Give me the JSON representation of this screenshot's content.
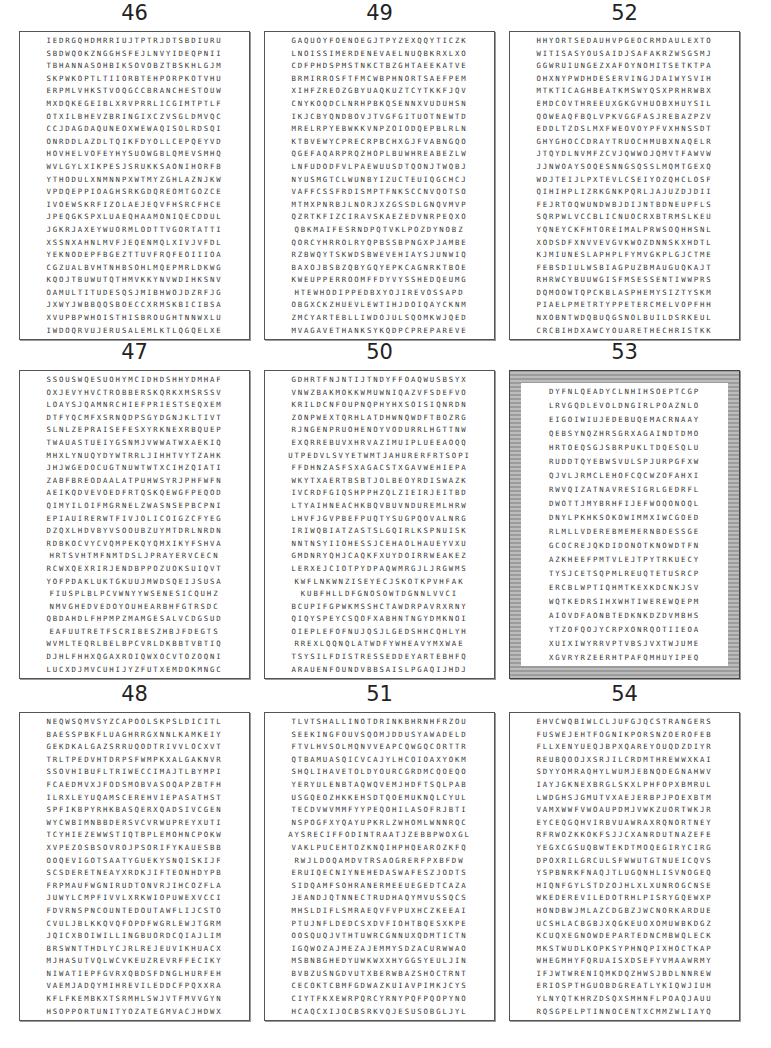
{
  "page": {
    "type": "word-search-answer-key"
  },
  "puzzles": [
    {
      "number": "46",
      "style": "plain",
      "found_words": [
        "ANNASOH",
        "TEHPORP",
        "BRANCHES",
        "BRING",
        "YEKNOD",
        "MULTITUDES",
        "WHOISTHIS",
        "BROUGHT",
        "JERUSALEM"
      ],
      "rows": [
        "IEDRGQHDMRRIUJTPTRJDTSBDIURU",
        "SBDWQOKZNGGHSFEJLNVYIDEQPNII",
        "TBHANNASOHBIKSOVOBZTBSKHLGJM",
        "SKPWKOPTLTIIORBTEHPORPKOTVHU",
        "ERPMLVHKSTVOQGCCBRANCHESTOUW",
        "MXDQKEGEIBLXRVPRRLICGIMTPTLF",
        "OTXILBHEVZBRINGIXCZVSGLDMVQC",
        "CCJDAGDAQUNEOXWEWAQISOLRDSQI",
        "ONRDDLAZDLTQIKFDYOLLCEPQEYVD",
        "HOVHELVOFEYHYSUOWGBLQMEVSMHQ",
        "WVLGYLXIKPESJSRUKKSAONIHORFB",
        "YTHODULXNMNNPXWTMYZGHLAZNJKW",
        "VPDQEPPIOAGHSRKGDQREOMTGOZCE",
        "IVOEWSKRFIZOLAEJEQVFHSRCFHCE",
        "JPEQGKSPXLUAEQHAAMONIQECDDUL",
        "JGKRJAXEYWUORMLODTTVGORTATTI",
        "XSSNXAHNLMVFJEQENMQLXIVJVFDL",
        "YEKNODEPFBGEZTTUVFRQFEOIIIOA",
        "CGZUALBVHTNHBSOHLMQEPMRLDKWG",
        "KQOJTBUWUTQTHMVKKYNVWDIHKSNV",
        "OAMULTITUDESQSJMIBHWOJDZRFJG",
        "JXWYJWBBQQSBOECCXRMSKBICIBSA",
        "XVUPBPWHOISTHISBROUGHTNNWXLU",
        "IWDOQRVUJERUSALEMLKTLQGQELXE"
      ]
    },
    {
      "number": "47",
      "style": "plain",
      "found_words": [
        "ESUOHYM",
        "ROBBERS",
        "CHIEFPRIESTS",
        "PRAISE",
        "WAS",
        "PRAYER",
        "DOYOUHEAR",
        "SCRIBES"
      ],
      "rows": [
        "SSOUSWQESUOHYMCIDHDSHHYDMHAF",
        "OXJEVYHVCTROBBERSKQRKXMSRSSV",
        "LOAYSJQAMNRCHIEFPRIESTSEQXEM",
        "DTFYQCMFXSRNQDPSGYDGNJKLTIVT",
        "SLNLZEPRAISEFESXYRKNEXRBQUEP",
        "TWAUASTUEIYGSNMJVWWATWXAEKIQ",
        "MHXLYNUQYDYWTRRLJIHHTVYTZAHK",
        "JHJWGEDOCUGTNUWTWTXCIHZQIATI",
        "ZABFBREODAALATPUHWSYRJPHFWFN",
        "AEIKQDVEVOEDFRTQSKQEWGFPEQOD",
        "QIMYILOIFMGRNELZWASNSEPBCPNI",
        "EPIAUIRERWTFIVJOLICOIGZCFYEG",
        "DZQXLHDVBYVSOOUBZUYMTDRLNRDN",
        "RDBKOCVYCVQMPEKQYQMXIKYFSHVA",
        "HRTSVHTMFNMTDSLJPRAYERVCECN",
        "RCWXQEXRIRJENDBPPOZUOKSUIQVT",
        "YOFPDAKLUKTGKUUJMWDSQEIJSUSA",
        "FIUSPLBLPCVWNYYWSENESICQUHZ",
        "NMVGHEDVEDOYOUHEARBHFGTRSDC",
        "QBDAHDLFHPMPZMAMGESALVCDGSUD",
        "EAFUUTRETFSCRIBESZHBJFDEGTS",
        "WVMLTEQRLBELBPCVRLDKBBTVBTIQ",
        "DJHLFHHXQGAXROIQWXOCVTOZOQNI",
        "LUCXDJMVCUHIJYZFUTXEMDOKMNGC"
      ]
    },
    {
      "number": "48",
      "style": "plain",
      "found_words": [
        "EVIGOT",
        "DERETNE",
        "GNIRUDTON",
        "COUNTEDOUT",
        "WILLING",
        "MIHREVILED",
        "OPPORTUNITY"
      ],
      "rows": [
        "NEQWSQMVSYZCAPOOLSKPSLDICITL",
        "BAESSPBKFLUAGHRRGXNNLKAMKEIY",
        "GEKDKALGAZSRRUQODTRIVVLOCXVT",
        "TRLTPEDVHTDRPSFWMPKXALGAKNVR",
        "SSOVHIBUFLTRIWECCIMAJTLBYMPI",
        "FCAEDMVXJFODSMOBVASOQAPZBTFH",
        "ILRXLEYUQAMSCEREHVIEPASATHST",
        "SPFIKBPYRHKBASQERXQADSIVCGEN",
        "WYCWBIMNBBDERSVCVRWUPREYXUTI",
        "TCYHIEZEWWSTIQTBPLEMOHNCPOKW",
        "XVPEZOSBSOVROJPSORIFYKAUESBB",
        "OOQEVIGOTSAATYGUEKYSNQISKIJF",
        "SCSDERETNEAYXRDKJIFTEONHDYPB",
        "FRPMAUFWGNIRUDTONVRJIHCOZFLA",
        "JUWYLCMPFIVVLXRKWIOPUWEXVCCI",
        "FDVRNSPNCOUNTEDOUTAWFLIJCSTO",
        "CVULJBLKKQVQFOPDFWGRLEWJTGRM",
        "JQICXBOIWILLINGBUORDCQIAJLIM",
        "BRSWNTTHDLYCJRLREJEUVIKHUACX",
        "MJHASUTVQLWCVKEUZREVRFFECIKY",
        "NIWATIEPFGVRXQBDSFDNGLHURFEH",
        "VAEMJADQYMIHREVILEDDCFPQXXRA",
        "KFLFKEMBKXTSRMHLSWJVTFMVVGYN",
        "HSOPPORTUNITYOZATEGMVACJHDWX"
      ]
    },
    {
      "number": "49",
      "style": "plain",
      "found_words": [
        "UOYFOENO",
        "YTIC",
        "NOISSIMER",
        "TAEEKAT",
        "TSAEF",
        "TUOTNEW",
        "UPPERROOM",
        "SHED",
        "EWHODIPPED",
        "REVOSSAP",
        "EVLEWT",
        "YARTEBLLIW",
        "GAVETHANKS",
        "PREPARE"
      ],
      "rows": [
        "GAQUOYFOENOEGJTPYZEXQQYTICZK",
        "LNOISSIMERDENEVAELNUQBKRXLXO",
        "CDFPHDSPMSTNKCTBZGHTAEEKATVE",
        "BRMIRROSFTFMCWBPHNORTSAEFPEM",
        "XIHFZREOZGBYUAQKUZTCYTKKFJQV",
        "CNYKOQDCLNRHPBKQSENNXVUDUHSN",
        "IKJCBYQNDBOVJTVGFGITUOTNEWTD",
        "MRELRPYEBWKKVNPZOIODQEPBLRLN",
        "KTBVEWYCPRECRPBCHXGJFVABNGQO",
        "QGEFAQARPRQZHOPLBUWHREABEZLW",
        "LNFUDODFVLPAEWUUSDTQONJTWQBJ",
        "NYUSMGTCLWUNBYIZUCTEUIQGCHCJ",
        "VAFFCSSFRDISMPTFNKSCCNVQOTSO",
        "MTMXPNRBJLNORJXZGSSDLGNQVMVP",
        "QZRTKFIZCIRAVSKAEZEDVNRPEQXO",
        "QBKMAIFESRNDPQTVKLPOZDYNOBZ",
        "QORCYHRROLRYQPBSSBPNGXPJAMBE",
        "RZBWQYTSKWDSBWEVEHIAYSJUNWIQ",
        "BAXOJBSBZQBYGQYEPKCAGNRKTBOE",
        "KWEUPPERROOMFFDYVYSSHEDQEUMG",
        "HTEWHODIPPEDBXYOJIREVOSSAPD",
        "OBGXCKZHUEVLEWTIHJDOIQAYCKNM",
        "ZMCYARTEBLLIWDOJULSQOMKWJQED",
        "MVAGAVETHANKSYKQDPCPREPAREVE"
      ]
    },
    {
      "number": "50",
      "style": "plain",
      "found_words": [
        "RUOHENO",
        "WEAKEZ",
        "SEYE",
        "SHCTAW",
        "HEAVY",
        "DISTRESSED",
        "DEYARTEB",
        "FOUND"
      ],
      "rows": [
        "GDHRTFNJNTIJTNDYFFOAQWUSBSYX",
        "VNWZBAKMOKKWMUWNIQAZVFSDEFVO",
        "KRILDCNFOUPNQPHYHXSOISIQNRDN",
        "ZONPWEXTQRHLATDHWNQWDFTBOZRG",
        "RJNGENPRUOHENOYVODURRLHGTTNW",
        "EXQRREBUVXHRVAZIMUIPLUEEAOQQ",
        "UTPEDVLSVYETWMTJAHURERFRTSOPI",
        "FFDHNZASFSXAGACSTXGAVWEHIEPA",
        "WKYTXAERTBSBTJOLBEOYRDISWAZK",
        "IVCRDFGIQSHPPHZQLZIEIRJEITBD",
        "LTYAIHNEACHKBQVBUVNDUREMLHRW",
        "LHVFJGVPBEFPUQTYSUGPQOVALNRG",
        "IRIWQBIATZASTSLGQIRLKSPNUISK",
        "NNTNSYIIOHESSJCEHAOLHAUEYVXU",
        "GMDNRYQHJCAQKFXUYDOIRRWEAKEZ",
        "LERXEJCIOTPYDPAQWMRGJLJRGWMS",
        "KWFLNKWNZISEYECJSKOTKPVHFAK",
        "KUBFHLLDFGNOSOWTDGNNLVVCI",
        "BCUPIFGPWKMSSHCTAWDRPAVRXRNY",
        "QIQYSPEYCSQOFXABHNTNGYDMKNOI",
        "OIEPLEFOFNUJQSJLGEDSHHCQHLYH",
        "RREXLQQNQLATWDFYWHEAVYMXWAE",
        "TSYSILFDISTRESSEDDEYARTEBHFQ",
        "ARAUENFOUNDVBBSAISLPGAQIJHDJ"
      ]
    },
    {
      "number": "51",
      "style": "plain",
      "found_words": [
        "SHALLINOTDRINK",
        "SEEKING",
        "YAWADEL",
        "IHAVETOLDYOU",
        "WHOM",
        "SRECIFFO",
        "PUCEHT",
        "EAR",
        "JESUS"
      ],
      "rows": [
        "TLVTSHALLINOTDRINKBHRNHFRZOU",
        "SEEKINGFOUVSQOMJDDUSYAWADELD",
        "FTVLHVSOLMQNVVEAPCQWGQCORTTR",
        "QTBAMUASQICVCAJYLHCOIOAXYOKM",
        "SHQLIHAVETOLDYOURCGRDMCQOEQO",
        "YERYULENBTAQWQVEMJHDFTSQLPAB",
        "USGQEOZHKKEHSDTQOEMUKNQLCYUL",
        "TECDVWVMMFYYPEQOHILASOFRJBTI",
        "NSPOGFXYQAYUPKRLZWHOMLWNNRQC",
        "AYSRECIFFODINTRAATJZEBBPWOXGL",
        "VAKLPUCEHTOZKNQIHPHQEAROZKFQ",
        "RWJLDOQAMDVTRSAOGRERFPXBFDW",
        "ERUIQECNIYNEHEDASWAFESZJODTS",
        "SIDQAMFSOHRANERMEEUEGEDTCAZA",
        "JEANDJQTNNECTRUDHAQYMVUSSQCS",
        "MHSLDIFLSMRAEQVFVPUXHCZKEEAI",
        "PTUJNFLDEDCSXDVFIOHTBQESXKPE",
        "OOSQUQJVTHTUWRCGNNUXQDMTICTN",
        "IGQWOZAJMEZAJEMMYSDZACURWWAO",
        "MSBNBGHEDYUWKWXXHYGGSYEULJIN",
        "BVBZUSNGDVUTXBERWBAZSHOCTRNT",
        "CECOKTCBMFGDWAZKUIAVPIMKJCYS",
        "CIYTFKXEWRPQRCYRNYPQFPQOPYNO",
        "HCAQCXIJOCBSRKVQJESUSOBGLJYL"
      ]
    },
    {
      "number": "52",
      "style": "plain",
      "found_words": [
        "YORTSED",
        "ITISASYOUSAID",
        "YNOMITSET",
        "DESERVING",
        "BEAT",
        "THREE",
        "COURTYARD",
        "LICNUOC",
        "TORE",
        "ESLAP",
        "SESSENTIW",
        "OWT",
        "BLASPHEMY",
        "ELPMET",
        "PETER",
        "BUILD",
        "YOUARETHECHRIST"
      ],
      "rows": [
        "HHYORTSEDAUHVPGEOCRMDAULEXTO",
        "WITISASYOUSAIDJSAFAKRZWSGSMJ",
        "GGWRUIUNGEZXAFOYNOMITSETKTPA",
        "OHXNYPWDHDESERVINGJDAIWYSVIH",
        "MTKTICAGHBEATKMSWYQSXPRHRWBX",
        "EMDCOVTHREEUXGKGVHUOBXHUYSIL",
        "QOWEAQFBQLVPKVGGFASJREBAZPZV",
        "EDDLTZDSLMXFWEOVOYPFVXHNSSDT",
        "GHYGHOCCDRAYTRUOCHMUBXNAQELR",
        "JTQYDLNVMFZCVJQWWOJQMVTFAWVW",
        "JJNWOAYSOQESNNGSQSSLMQMTGEXQ",
        "WDJTEIJLPXTEVLCSEIYOZQHCLOSF",
        "QIHIHPLIZRKGNKPQRLJAJUZDJDII",
        "FEJRTOQWUNDWBJDIJNTBDNEUPFLS",
        "SQRPWLVCCBLICNUOCRXBTRMSLKEU",
        "YQNEYCKFHTOREIMALPRWSOQHHSNL",
        "XODSDFXNVVEVGVKWOZDNNSKXHDTL",
        "KJMIUNESLAPHPLFYMVGKPLGJCTME",
        "FEBSDIULWSBIAGPUZBMAUGUQKAJT",
        "RHRWCYBUUWGISFMSESSENTIWWPRS",
        "DQMOOWTQPCKBLASPHEMYSIZTYSKM",
        "PIAELPMETRTYPPETERCMELVOPFHH",
        "NXOBNTWDQBUQGSNOLBUILDSRKEUL",
        "CRCBIHDXAWCYOUARETHECHRISTKK"
      ]
    },
    {
      "number": "53",
      "style": "decorated",
      "found_words": [
        "GIRL",
        "EMAC",
        "AGAIN",
        "TNAVRES",
        "DEREBMEMER",
        "IDONOTKNOW",
        "WHTIWEREW",
        "EERHT"
      ],
      "rows": [
        "DYFNLQEADYCLNHIHSOEPTCGP",
        "LRVGQDLEVOLDNGIRLPOAZNLO",
        "EIGOIWIUJEDEBUQEMACRNAAY",
        "QEBSYNQZHRSGRXAGAINDTDMO",
        "HRTOEQSGJSBRPUKLTDQESQLU",
        "RUDDTQYEBWSVULSPJURPGFXW",
        "QJVLJRMCLEHOFCQCWZOFAHXI",
        "RWVQIZATNAVRESIGRLGEDRFL",
        "DWOTTJMYBRHFIJEFWOQONOQL",
        "DNYLPKHKSOKOWIMMXIWCGOED",
        "RLMLLVDEREBMEMERNBDESSGE",
        "GCOCREJQKDIDONOTKNOWDTFN",
        "AZKHEEFPMTVLEJTPYTRKUECY",
        "TYSJCETSQPMLREUQTETUSRCP",
        "ERCBLWPTIQHMTKEXKDCNKJSV",
        "WQTKEDRSIHXWHTIWEREWQEPM",
        "AIOVDFAONBTEDKNKDZDVMBHS",
        "YTZOFQOJYCRPXONRQOTIIEOA",
        "XUIXIWYRRVPTVBSJVXTWJUME",
        "XGVRYRZEERHTPAFQMHUYIPEQ"
      ]
    },
    {
      "number": "54",
      "style": "plain",
      "found_words": [
        "STRANGERS",
        "SWEJEHTFOGNIK",
        "EROFEB",
        "AREYOU",
        "THREW",
        "DEGNAH",
        "DEREVILED",
        "DEPARTED",
        "THGUOB",
        "GREATLY",
        "INNOCENT"
      ],
      "rows": [
        "EHVCWQBIWLCLJUFGJQCSTRANGERS",
        "FUSWEJEHTFOGNIKPORSNZOEROFEB",
        "FLLXENYUEQJBPXQAREYOUQDZDIYR",
        "REUBQOOJXSRJILCRDMTHREWWXKAI",
        "SDYYOMRAQHYLWUMJEBNQDEGNAHWV",
        "IAYJGKNEXBRGLSKXLPHFOPXBMRUL",
        "LWDGHSJGMUTVXAEJERBPJPOEXBTM",
        "VAMXWWFVWOAUPDMJVWKZUORTWKJR",
        "EYCEQGQHVIRBVUAWRAXRQNORTNEY",
        "RFRWOZKKOKFSJJCXANRDUTNAZEFE",
        "YEGXCGSUQBWTEKDTMOQEGIRYCIRG",
        "DPOXRILGRCULSFWWUTGTNUEICQVS",
        "YSPBNRKFNAQJTLUGQNHLISVNOGEQ",
        "HIQNFGYLSTDZOJHLXLXUNROGCNSE",
        "WKEDEREVILEDOTRHLPISRYGQEWXP",
        "HONDBWJMLAZCDGBZJWCNORKARDUE",
        "UCSHLACBGBJXQGKEUOXOMUWBKDGZ",
        "KCUQXEGNOWDEPARTEDNCMBWQLECK",
        "MKSTWUDLKOPKSYPHNQPIXHOCTKAP",
        "WHEGMHYFQRUAISXDSEFYVMAAWRMY",
        "IFJWTWRENIQMKDQZHWSJBDLNNREW",
        "ERIOSPTHGUOBDGREATLYKIQWJIUH",
        "YLNYQTKHRZDSQXSMHNFLPOAQJAUU",
        "RQSGPELPTINNOCENTXCMMZWLIAYQ"
      ]
    }
  ]
}
